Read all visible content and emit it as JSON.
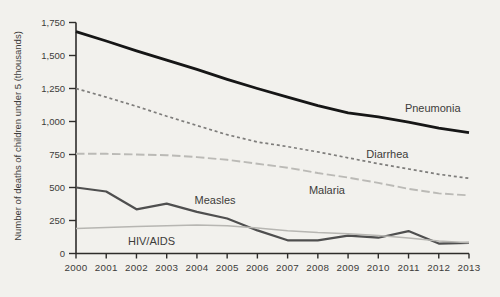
{
  "figure": {
    "background": "#f2f1ed",
    "text_color": "#3d3c3a",
    "axis_color": "#2e2d2b"
  },
  "chart_data": {
    "type": "line",
    "title": "",
    "xlabel": "",
    "ylabel": "Number of deaths of children under 5 (thousands)",
    "x": [
      2000,
      2001,
      2002,
      2003,
      2004,
      2005,
      2006,
      2007,
      2008,
      2009,
      2010,
      2011,
      2012,
      2013
    ],
    "x_tick_labels": [
      "2000",
      "2001",
      "2002",
      "2003",
      "2004",
      "2005",
      "2006",
      "2007",
      "2008",
      "2009",
      "2010",
      "2011",
      "2012",
      "2013"
    ],
    "ylim": [
      0,
      1750
    ],
    "yticks": [
      0,
      250,
      500,
      750,
      1000,
      1250,
      1500,
      1750
    ],
    "ytick_labels": [
      "0",
      "250",
      "500",
      "750",
      "1,000",
      "1,250",
      "1,500",
      "1,750"
    ],
    "grid": false,
    "legend": "inline-labels",
    "series": [
      {
        "name": "Pneumonia",
        "values": [
          1680,
          1610,
          1535,
          1465,
          1395,
          1320,
          1250,
          1185,
          1120,
          1065,
          1035,
          995,
          950,
          915
        ],
        "color": "#161616",
        "style": "solid",
        "width": 2.8,
        "label_at": {
          "x": 2011.8,
          "y": 1100
        }
      },
      {
        "name": "Diarrhea",
        "values": [
          1250,
          1185,
          1115,
          1040,
          970,
          900,
          845,
          810,
          770,
          725,
          680,
          640,
          600,
          570
        ],
        "color": "#7e7d7b",
        "style": "dashed-short",
        "width": 1.7,
        "label_at": {
          "x": 2010.3,
          "y": 755
        }
      },
      {
        "name": "Malaria",
        "values": [
          755,
          755,
          750,
          745,
          730,
          710,
          680,
          650,
          610,
          575,
          535,
          490,
          455,
          440
        ],
        "color": "#bbbab6",
        "style": "dashed-long",
        "width": 1.9,
        "label_at": {
          "x": 2008.3,
          "y": 480
        }
      },
      {
        "name": "Measles",
        "values": [
          500,
          470,
          335,
          378,
          315,
          265,
          175,
          100,
          100,
          135,
          120,
          170,
          75,
          80
        ],
        "color": "#4f4f4f",
        "style": "solid",
        "width": 2.2,
        "label_at": {
          "x": 2004.6,
          "y": 405
        }
      },
      {
        "name": "HIV/AIDS",
        "values": [
          190,
          197,
          204,
          210,
          215,
          210,
          193,
          172,
          158,
          150,
          136,
          118,
          95,
          82
        ],
        "color": "#b7b6b2",
        "style": "solid",
        "width": 1.5,
        "label_at": {
          "x": 2002.5,
          "y": 95
        }
      }
    ]
  }
}
